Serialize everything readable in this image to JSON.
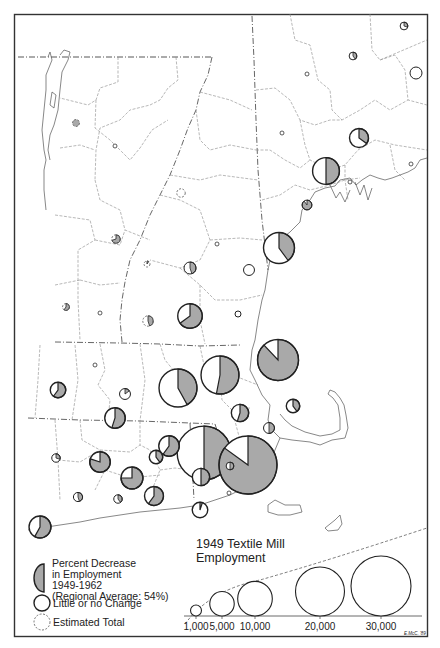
{
  "map": {
    "title": "1949 Textile Mill Employment",
    "title_line1": "1949 Textile Mill",
    "title_line2": "Employment",
    "credit": "E.McC. '89",
    "colors": {
      "decrease_fill": "#a9a9a9",
      "outline": "#222222",
      "boundary": "#777777",
      "frame": "#333333",
      "background": "#ffffff"
    }
  },
  "legend": {
    "decrease": {
      "line1": "Percent Decrease",
      "line2": "in Employment",
      "line3": "1949-1962",
      "line4": "(Regional Average: 54%)",
      "icon": "half-shaded-circle-icon"
    },
    "no_change": {
      "label": "Little or no Change",
      "icon": "open-circle-icon"
    },
    "estimated": {
      "label": "Estimated Total",
      "icon": "dashed-circle-icon"
    },
    "scale": [
      {
        "value": 1000,
        "label": "1,000"
      },
      {
        "value": 5000,
        "label": "5,000"
      },
      {
        "value": 10000,
        "label": "10,000"
      },
      {
        "value": 20000,
        "label": "20,000"
      },
      {
        "value": 30000,
        "label": "30,000"
      }
    ]
  },
  "chart_data": {
    "type": "proportional-symbol-pie-map",
    "title": "1949 Textile Mill Employment",
    "region": "New England",
    "regional_average_decrease_pct": 54,
    "symbols": [
      {
        "id": "vt-nw-estimated",
        "employment": 400,
        "decrease_pct": 100,
        "estimated": true
      },
      {
        "id": "vt-central-dot",
        "employment": 50,
        "decrease_pct": 0,
        "estimated": false
      },
      {
        "id": "vt-east-estimated",
        "employment": 600,
        "decrease_pct": 0,
        "estimated": true
      },
      {
        "id": "me-north-1",
        "employment": 500,
        "decrease_pct": 30,
        "estimated": false
      },
      {
        "id": "me-north-2",
        "employment": 500,
        "decrease_pct": 40,
        "estimated": false
      },
      {
        "id": "me-east-open",
        "employment": 1200,
        "decrease_pct": 0,
        "estimated": false
      },
      {
        "id": "nh-north-dot",
        "employment": 50,
        "decrease_pct": 0,
        "estimated": false
      },
      {
        "id": "nh-central-dot",
        "employment": 50,
        "decrease_pct": 0,
        "estimated": false
      },
      {
        "id": "me-central",
        "employment": 3000,
        "decrease_pct": 35,
        "estimated": false
      },
      {
        "id": "me-lewiston",
        "employment": 6000,
        "decrease_pct": 50,
        "estimated": false
      },
      {
        "id": "me-coast-dot",
        "employment": 50,
        "decrease_pct": 0,
        "estimated": false
      },
      {
        "id": "me-coast-dot2",
        "employment": 50,
        "decrease_pct": 0,
        "estimated": false
      },
      {
        "id": "me-south-shaded",
        "employment": 800,
        "decrease_pct": 90,
        "estimated": false
      },
      {
        "id": "vt-mid-estimated",
        "employment": 600,
        "decrease_pct": 70,
        "estimated": true
      },
      {
        "id": "vt-mid2-estimated",
        "employment": 300,
        "decrease_pct": 10,
        "estimated": true
      },
      {
        "id": "nh-small-estimated",
        "employment": 200,
        "decrease_pct": 50,
        "estimated": true
      },
      {
        "id": "nh-central",
        "employment": 1200,
        "decrease_pct": 45,
        "estimated": false
      },
      {
        "id": "nh-south",
        "employment": 5000,
        "decrease_pct": 65,
        "estimated": false
      },
      {
        "id": "nh-small-open",
        "employment": 1000,
        "decrease_pct": 0,
        "estimated": false
      },
      {
        "id": "nh-small-open2",
        "employment": 300,
        "decrease_pct": 0,
        "estimated": false
      },
      {
        "id": "vt-sw-estimated",
        "employment": 400,
        "decrease_pct": 60,
        "estimated": true
      },
      {
        "id": "vt-s-dot",
        "employment": 50,
        "decrease_pct": 0,
        "estimated": false
      },
      {
        "id": "vt-se-estimated",
        "employment": 900,
        "decrease_pct": 45,
        "estimated": true
      },
      {
        "id": "nh-manchester",
        "employment": 8000,
        "decrease_pct": 40,
        "estimated": false
      },
      {
        "id": "ma-lowell",
        "employment": 14000,
        "decrease_pct": 88,
        "estimated": false
      },
      {
        "id": "ma-nw-1",
        "employment": 2000,
        "decrease_pct": 60,
        "estimated": false
      },
      {
        "id": "ma-nw-small",
        "employment": 200,
        "decrease_pct": 10,
        "estimated": false
      },
      {
        "id": "ma-n-central",
        "employment": 1000,
        "decrease_pct": 15,
        "estimated": false
      },
      {
        "id": "ma-worcester-n",
        "employment": 12000,
        "decrease_pct": 42,
        "estimated": false
      },
      {
        "id": "ma-lawrence",
        "employment": 12000,
        "decrease_pct": 53,
        "estimated": false
      },
      {
        "id": "ma-central",
        "employment": 3500,
        "decrease_pct": 55,
        "estimated": false
      },
      {
        "id": "ma-boston",
        "employment": 1500,
        "decrease_pct": 40,
        "estimated": false
      },
      {
        "id": "ma-south-shore",
        "employment": 1000,
        "decrease_pct": 50,
        "estimated": false
      },
      {
        "id": "ma-springfield",
        "employment": 4000,
        "decrease_pct": 75,
        "estimated": false
      },
      {
        "id": "ma-worcester",
        "employment": 24000,
        "decrease_pct": 50,
        "estimated": false
      },
      {
        "id": "ma-fall-river",
        "employment": 28000,
        "decrease_pct": 85,
        "estimated": false
      },
      {
        "id": "ma-newbedford-area",
        "employment": 2500,
        "decrease_pct": 55,
        "estimated": false
      },
      {
        "id": "ct-hartford-small",
        "employment": 600,
        "decrease_pct": 30,
        "estimated": false
      },
      {
        "id": "ct-central",
        "employment": 3500,
        "decrease_pct": 80,
        "estimated": false
      },
      {
        "id": "ct-east",
        "employment": 1500,
        "decrease_pct": 40,
        "estimated": false
      },
      {
        "id": "ri-north",
        "employment": 3500,
        "decrease_pct": 60,
        "estimated": false
      },
      {
        "id": "ri-providence",
        "employment": 2500,
        "decrease_pct": 50,
        "estimated": false
      },
      {
        "id": "ri-small-1",
        "employment": 500,
        "decrease_pct": 50,
        "estimated": false
      },
      {
        "id": "ri-small-2",
        "employment": 200,
        "decrease_pct": 60,
        "estimated": false
      },
      {
        "id": "ct-southwest-small",
        "employment": 700,
        "decrease_pct": 45,
        "estimated": false
      },
      {
        "id": "ct-south-central",
        "employment": 600,
        "decrease_pct": 40,
        "estimated": false
      },
      {
        "id": "ct-new-london",
        "employment": 3000,
        "decrease_pct": 60,
        "estimated": false
      },
      {
        "id": "ri-south",
        "employment": 2000,
        "decrease_pct": 5,
        "estimated": false
      },
      {
        "id": "ct-southwest",
        "employment": 4000,
        "decrease_pct": 58,
        "estimated": false
      }
    ]
  }
}
